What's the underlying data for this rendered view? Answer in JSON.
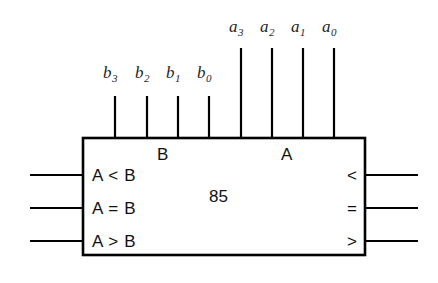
{
  "diagram": {
    "device_number": "85",
    "background_color": "#ffffff",
    "line_color": "#000000",
    "text_color": "#111111",
    "body": {
      "x": 83,
      "y": 138,
      "width": 282,
      "height": 117
    },
    "group_labels": {
      "b_group": "B",
      "a_group": "A"
    },
    "top_pins": [
      {
        "name": "b3",
        "base": "b",
        "sub": "3",
        "x": 115,
        "label_x": 103,
        "label_y": 64,
        "top_y": 96
      },
      {
        "name": "b2",
        "base": "b",
        "sub": "2",
        "x": 147,
        "label_x": 135,
        "label_y": 64,
        "top_y": 96
      },
      {
        "name": "b1",
        "base": "b",
        "sub": "1",
        "x": 178,
        "label_x": 166,
        "label_y": 64,
        "top_y": 96
      },
      {
        "name": "b0",
        "base": "b",
        "sub": "0",
        "x": 209,
        "label_x": 197,
        "label_y": 64,
        "top_y": 96
      },
      {
        "name": "a3",
        "base": "a",
        "sub": "3",
        "x": 241,
        "label_x": 229,
        "label_y": 18,
        "top_y": 48
      },
      {
        "name": "a2",
        "base": "a",
        "sub": "2",
        "x": 272,
        "label_x": 260,
        "label_y": 18,
        "top_y": 48
      },
      {
        "name": "a1",
        "base": "a",
        "sub": "1",
        "x": 303,
        "label_x": 291,
        "label_y": 18,
        "top_y": 48
      },
      {
        "name": "a0",
        "base": "a",
        "sub": "0",
        "x": 334,
        "label_x": 322,
        "label_y": 18,
        "top_y": 48
      }
    ],
    "left_inputs": [
      {
        "label": "A < B",
        "y": 175,
        "wire_start_x": 30
      },
      {
        "label": "A = B",
        "y": 208,
        "wire_start_x": 30
      },
      {
        "label": "A > B",
        "y": 241,
        "wire_start_x": 30
      }
    ],
    "right_outputs": [
      {
        "label": "<",
        "y": 175,
        "wire_end_x": 418
      },
      {
        "label": "=",
        "y": 208,
        "wire_end_x": 418
      },
      {
        "label": ">",
        "y": 241,
        "wire_end_x": 418
      }
    ]
  }
}
